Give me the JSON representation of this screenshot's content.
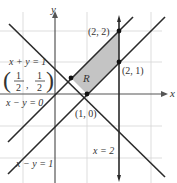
{
  "diagram": {
    "axes": {
      "x_label": "x",
      "y_label": "y"
    },
    "region_label": "R",
    "points": [
      {
        "label": "(2, 2)",
        "x": 2,
        "y": 2
      },
      {
        "label": "(2, 1)",
        "x": 2,
        "y": 1
      },
      {
        "label": "(1, 0)",
        "x": 1,
        "y": 0
      },
      {
        "label_num1": "1",
        "label_den1": "2",
        "label_num2": "1",
        "label_den2": "2",
        "x": 0.5,
        "y": 0.5
      }
    ],
    "lines": [
      {
        "label": "x + y = 1",
        "equation": "x + y = 1"
      },
      {
        "label": "x − y = 0",
        "equation": "x - y = 0"
      },
      {
        "label": "x − y = 1",
        "equation": "x - y = 1"
      },
      {
        "label": "x = 2",
        "equation": "x = 2"
      }
    ],
    "colors": {
      "region_fill": "#c4c4c4",
      "line": "#2a2a2a",
      "grid": "#d0d0d0"
    }
  }
}
